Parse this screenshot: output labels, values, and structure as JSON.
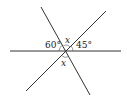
{
  "diagram": {
    "type": "intersecting-lines-angles",
    "colors": {
      "line": "#333333",
      "text": "#222222",
      "background": "#ffffff"
    },
    "lines": [
      {
        "name": "horizontal-line",
        "x1": 10,
        "y1": 51,
        "x2": 121,
        "y2": 51
      },
      {
        "name": "steep-line",
        "x1": 41,
        "y1": 7,
        "x2": 90,
        "y2": 95
      },
      {
        "name": "diagonal-line",
        "x1": 106,
        "y1": 11,
        "x2": 26,
        "y2": 91
      }
    ],
    "labels": {
      "angle_left": "60°",
      "angle_top": "x",
      "angle_right": "45°",
      "angle_bottom": "x"
    }
  }
}
